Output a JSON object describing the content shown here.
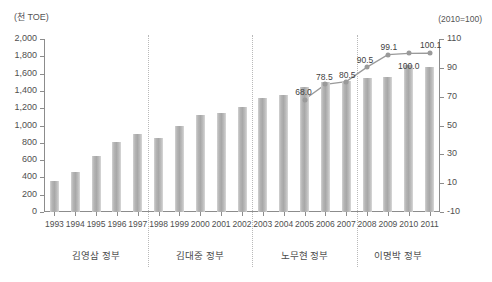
{
  "axis": {
    "left_unit": "(천 TOE)",
    "right_unit": "(2010=100)",
    "left_ticks": [
      "2,000",
      "1,800",
      "1,600",
      "1,400",
      "1,200",
      "1,000",
      "800",
      "600",
      "400",
      "200",
      "0"
    ],
    "right_ticks": [
      "110",
      "90",
      "70",
      "50",
      "30",
      "10",
      "-10"
    ]
  },
  "chart_data": {
    "type": "bar",
    "title": "",
    "subtitle": "",
    "xlabel": "",
    "ylabel": "(천 TOE)",
    "y2label": "(2010=100)",
    "ylim": [
      0,
      2000
    ],
    "y2lim": [
      -10,
      110
    ],
    "grid": false,
    "legend": "none",
    "categories": [
      "1993",
      "1994",
      "1995",
      "1996",
      "1997",
      "1998",
      "1999",
      "2000",
      "2001",
      "2002",
      "2003",
      "2004",
      "2005",
      "2006",
      "2007",
      "2008",
      "2009",
      "2010",
      "2011"
    ],
    "series": [
      {
        "name": "에너지 소비 (천 TOE)",
        "type": "bar",
        "axis": "left",
        "values": [
          357,
          468,
          643,
          812,
          905,
          860,
          995,
          1122,
          1148,
          1210,
          1315,
          1355,
          1445,
          1500,
          1520,
          1545,
          1565,
          1705,
          1675
        ]
      },
      {
        "name": "에너지 원단위 지수 (2010=100)",
        "type": "line",
        "axis": "right",
        "values": [
          null,
          null,
          null,
          null,
          null,
          null,
          null,
          null,
          null,
          null,
          null,
          null,
          68.0,
          78.5,
          80.5,
          90.5,
          99.1,
          100.0,
          100.1
        ],
        "point_labels": {
          "2005": "68.0",
          "2006": "78.5",
          "2007": "80.5",
          "2008": "90.5",
          "2009": "99.1",
          "2010": "100.0",
          "2011": "100.1"
        }
      }
    ],
    "groups": [
      {
        "label": "김영삼 정부",
        "from": "1993",
        "to": "1997"
      },
      {
        "label": "김대중 정부",
        "from": "1998",
        "to": "2002"
      },
      {
        "label": "노무현 정부",
        "from": "2003",
        "to": "2007"
      },
      {
        "label": "이명박 정부",
        "from": "2008",
        "to": "2011"
      }
    ],
    "colors": {
      "bar": "#b0b0b0",
      "line": "#9a9a9a",
      "axis": "#8c8c8c",
      "text": "#4a4a4a",
      "divider": "#b9b9b9"
    }
  }
}
